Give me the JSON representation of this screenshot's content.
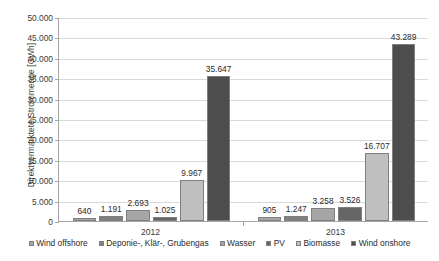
{
  "chart_data": {
    "type": "bar",
    "title": "",
    "xlabel": "",
    "ylabel": "Direktvermarktete Strommenge [GWh]",
    "ylim": [
      0,
      50000
    ],
    "ytick_labels": [
      "50.000",
      "45.000",
      "40.000",
      "35.000",
      "30.000",
      "25.000",
      "20.000",
      "15.000",
      "10.000",
      "5.000",
      "0"
    ],
    "ytick_values": [
      50000,
      45000,
      40000,
      35000,
      30000,
      25000,
      20000,
      15000,
      10000,
      5000,
      0
    ],
    "grid": true,
    "legend_position": "bottom",
    "categories": [
      "2012",
      "2013"
    ],
    "series": [
      {
        "name": "Wind offshore",
        "color": "#A6A6A6",
        "values": [
          640,
          905
        ],
        "labels": [
          "640",
          "905"
        ]
      },
      {
        "name": "Deponie-, Klär-, Grubengas",
        "color": "#808080",
        "values": [
          1191,
          1247
        ],
        "labels": [
          "1.191",
          "1.247"
        ]
      },
      {
        "name": "Wasser",
        "color": "#A6A6A6",
        "values": [
          2693,
          3258
        ],
        "labels": [
          "2.693",
          "3.258"
        ]
      },
      {
        "name": "PV",
        "color": "#666666",
        "values": [
          1025,
          3526
        ],
        "labels": [
          "1.025",
          "3.526"
        ]
      },
      {
        "name": "Biomasse",
        "color": "#BFBFBF",
        "values": [
          9967,
          16707
        ],
        "labels": [
          "9.967",
          "16.707"
        ]
      },
      {
        "name": "Wind onshore",
        "color": "#4D4D4D",
        "values": [
          35647,
          43289
        ],
        "labels": [
          "35.647",
          "43.289"
        ]
      }
    ]
  },
  "legend": {
    "items": [
      {
        "label": "Wind offshore"
      },
      {
        "label": "Deponie-, Klär-, Grubengas"
      },
      {
        "label": "Wasser"
      },
      {
        "label": "PV"
      },
      {
        "label": "Biomasse"
      },
      {
        "label": "Wind onshore"
      }
    ]
  }
}
